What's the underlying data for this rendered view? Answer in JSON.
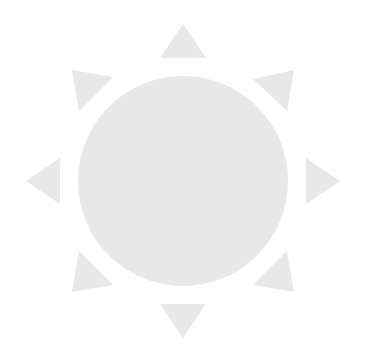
{
  "canvas": {
    "width": 367,
    "height": 359,
    "background_color": "#ffffff"
  },
  "icon": {
    "name": "sun-icon",
    "semantic_label": "sun",
    "fill_color": "#e8e8e8",
    "center": {
      "x": 183,
      "y": 181
    }
  },
  "shapes": {
    "disc": {
      "name": "sun-disc",
      "cx": 183,
      "cy": 181,
      "r": 105
    },
    "rays": [
      {
        "name": "sun-ray-north",
        "direction": "north",
        "angle_deg": 270,
        "points": "183,24 206,58 160,58"
      },
      {
        "name": "sun-ray-northeast",
        "direction": "northeast",
        "angle_deg": 315,
        "points": "294,70 287,111 253,79"
      },
      {
        "name": "sun-ray-east",
        "direction": "east",
        "angle_deg": 0,
        "points": "340,181 306,204 306,158"
      },
      {
        "name": "sun-ray-southeast",
        "direction": "southeast",
        "angle_deg": 45,
        "points": "294,292 253,285 287,251"
      },
      {
        "name": "sun-ray-south",
        "direction": "south",
        "angle_deg": 90,
        "points": "183,338 160,304 206,304"
      },
      {
        "name": "sun-ray-southwest",
        "direction": "southwest",
        "angle_deg": 135,
        "points": "72,292 79,251 113,285"
      },
      {
        "name": "sun-ray-west",
        "direction": "west",
        "angle_deg": 180,
        "points": "26,181 60,158 60,204"
      },
      {
        "name": "sun-ray-northwest",
        "direction": "northwest",
        "angle_deg": 225,
        "points": "72,70 113,77 79,111"
      }
    ]
  }
}
